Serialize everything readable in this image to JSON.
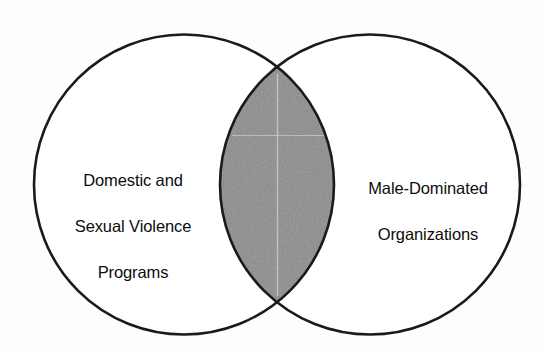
{
  "diagram": {
    "type": "venn",
    "title": "",
    "background_color": "#fefefe",
    "stroke_color": "#1a1a1a",
    "stroke_width": 2.6,
    "intersection_fill": "#8a8a8a",
    "text_color": "#0d0d0d",
    "sets": [
      {
        "id": "left",
        "name": "domestic-and-sexual-violence-programs",
        "label_lines": [
          "Domestic and",
          "Sexual Violence",
          "Programs"
        ],
        "label_text": "Domestic and Sexual Violence Programs",
        "fill": "#ffffff",
        "center_x": 184,
        "center_y": 184.5,
        "radius": 150
      },
      {
        "id": "right",
        "name": "male-dominated-organizations",
        "label_lines": [
          "Male-Dominated",
          "Organizations"
        ],
        "label_text": "Male-Dominated Organizations",
        "fill": "#ffffff",
        "center_x": 370,
        "center_y": 184.5,
        "radius": 150
      }
    ],
    "intersection": {
      "name": "overlap-region",
      "label": "",
      "fill": "#8a8a8a",
      "left_x": 222,
      "right_x": 332,
      "top_vertex_x": 277,
      "top_vertex_y": 72,
      "bottom_vertex_x": 277,
      "bottom_vertex_y": 298
    }
  },
  "labels": {
    "left": {
      "line1": "Domestic and",
      "line2": "Sexual Violence",
      "line3": "Programs"
    },
    "right": {
      "line1": "Male-Dominated",
      "line2": "Organizations"
    }
  }
}
